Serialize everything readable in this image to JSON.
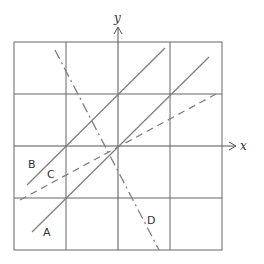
{
  "diagram": {
    "axes": {
      "x_label": "x",
      "y_label": "y"
    },
    "grid": {
      "cells": 4,
      "unit_px": 52,
      "origin_px": [
        118,
        146
      ]
    },
    "lines": [
      {
        "id": "A",
        "label": "A",
        "style": "solid",
        "equation": "y = x"
      },
      {
        "id": "B",
        "label": "B",
        "style": "solid",
        "equation": "y = x + 1"
      },
      {
        "id": "C",
        "label": "C",
        "style": "dashed",
        "equation": "y = x/2"
      },
      {
        "id": "D",
        "label": "D",
        "style": "dash-dot",
        "equation": "y = -2x"
      }
    ],
    "colors": {
      "grid": "#555555",
      "lines": "#777777",
      "text": "#333333"
    }
  }
}
